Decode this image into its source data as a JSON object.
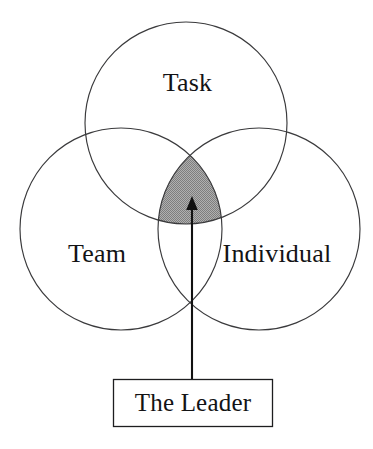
{
  "diagram": {
    "type": "venn-three-circle",
    "background_color": "#ffffff",
    "stroke_color": "#3a3a3c",
    "text_color": "#131315",
    "overlap_fill_color": "#9a9a9a",
    "arrow_color": "#111111",
    "circles": [
      {
        "id": "task",
        "label": "Task",
        "center_x": 186,
        "center_y": 123,
        "radius": 101
      },
      {
        "id": "team",
        "label": "Team",
        "center_x": 121,
        "center_y": 229,
        "radius": 101
      },
      {
        "id": "individual",
        "label": "Individual",
        "center_x": 259,
        "center_y": 229,
        "radius": 101
      }
    ],
    "overlap": {
      "name": "core-overlap",
      "description": "shaded triple intersection",
      "fill": "#9a9a9a"
    },
    "callout": {
      "label": "The Leader",
      "box_x": 113,
      "box_y": 379,
      "box_width": 160,
      "box_height": 48
    },
    "arrow": {
      "from_x": 192,
      "from_y": 379,
      "to_x": 192,
      "to_y": 197
    }
  }
}
